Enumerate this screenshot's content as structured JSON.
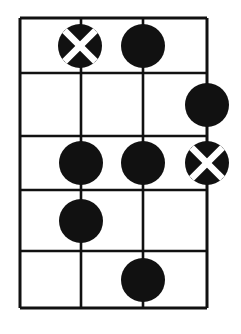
{
  "figure": {
    "title": "Grid board diagram with stones",
    "canvas": {
      "width": 241,
      "height": 334,
      "background": "#ffffff"
    },
    "ink_color": "#111111",
    "mark_color": "#ffffff"
  },
  "grid": {
    "name": "board-grid",
    "columns": 3,
    "rows": 5,
    "line_color": "#111111",
    "outer_line_width": 3,
    "inner_line_width": 2.6,
    "vertical_lines_x": [
      20,
      81,
      143,
      207
    ],
    "horizontal_lines_y": [
      18,
      73,
      136,
      190,
      251,
      308
    ],
    "column_labels": [
      "A",
      "B",
      "C"
    ],
    "row_labels": [
      "1",
      "2",
      "3",
      "4",
      "5"
    ]
  },
  "stones": [
    {
      "id": "stone-1",
      "name": "stone-cross-r1-line-b",
      "type": "cross",
      "fill": "#111111",
      "mark": "#ffffff",
      "cx": 80,
      "cy": 46,
      "r": 22,
      "label": "X"
    },
    {
      "id": "stone-2",
      "name": "stone-filled-r1-line-c",
      "type": "filled",
      "fill": "#111111",
      "cx": 143,
      "cy": 46,
      "r": 22,
      "label": ""
    },
    {
      "id": "stone-3",
      "name": "stone-filled-r2-line-right",
      "type": "filled",
      "fill": "#111111",
      "cx": 207,
      "cy": 105,
      "r": 22,
      "label": ""
    },
    {
      "id": "stone-4",
      "name": "stone-filled-r3-line-b",
      "type": "filled",
      "fill": "#111111",
      "cx": 81,
      "cy": 163,
      "r": 22,
      "label": ""
    },
    {
      "id": "stone-5",
      "name": "stone-filled-r3-line-c",
      "type": "filled",
      "fill": "#111111",
      "cx": 143,
      "cy": 163,
      "r": 22,
      "label": ""
    },
    {
      "id": "stone-6",
      "name": "stone-cross-r3-line-right",
      "type": "cross",
      "fill": "#111111",
      "mark": "#ffffff",
      "cx": 207,
      "cy": 163,
      "r": 22,
      "label": "X"
    },
    {
      "id": "stone-7",
      "name": "stone-filled-r4-line-b",
      "type": "filled",
      "fill": "#111111",
      "cx": 81,
      "cy": 221,
      "r": 22,
      "label": ""
    },
    {
      "id": "stone-8",
      "name": "stone-filled-r5-line-c",
      "type": "filled",
      "fill": "#111111",
      "cx": 143,
      "cy": 280,
      "r": 22,
      "label": ""
    }
  ],
  "legend": {
    "filled_label": "filled stone",
    "cross_label": "marked stone (X)"
  }
}
